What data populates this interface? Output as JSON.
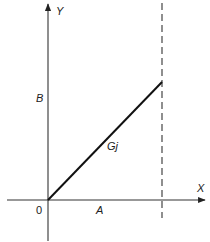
{
  "diagram": {
    "type": "xy-graph",
    "axes": {
      "x_label": "X",
      "y_label": "Y",
      "origin_label": "0"
    },
    "labels": {
      "a": "A",
      "b": "B",
      "line": "Gj"
    },
    "elements": [
      {
        "kind": "axis",
        "name": "x-axis",
        "direction": "horizontal",
        "arrow": "right"
      },
      {
        "kind": "axis",
        "name": "y-axis",
        "direction": "vertical",
        "arrow": "up"
      },
      {
        "kind": "line",
        "name": "Gj",
        "from": "origin",
        "to": "(A, B)",
        "style": "solid"
      },
      {
        "kind": "line",
        "name": "x=A",
        "style": "dashed",
        "direction": "vertical"
      }
    ],
    "colors": {
      "ink": "#222222",
      "background": "#ffffff"
    }
  }
}
